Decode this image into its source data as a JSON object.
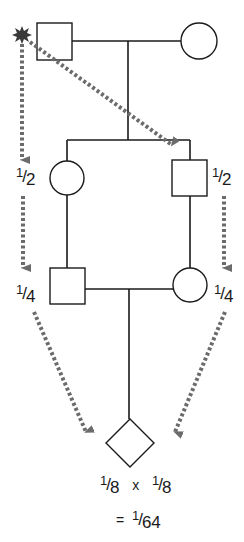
{
  "diagram": {
    "type": "pedigree",
    "colors": {
      "line": "#1a1a1a",
      "arrow": "#6b6b6b",
      "marker": "#3a3a3a",
      "background": "#ffffff"
    },
    "generations": [
      {
        "level": 1,
        "individuals": [
          {
            "id": "common-ancestor-male",
            "shape": "square",
            "marked": true
          },
          {
            "id": "ancestor-female",
            "shape": "circle"
          }
        ]
      },
      {
        "level": 2,
        "individuals": [
          {
            "id": "daughter",
            "shape": "circle"
          },
          {
            "id": "son",
            "shape": "square"
          }
        ]
      },
      {
        "level": 3,
        "individuals": [
          {
            "id": "grandson",
            "shape": "square"
          },
          {
            "id": "granddaughter",
            "shape": "circle"
          }
        ]
      },
      {
        "level": 4,
        "individuals": [
          {
            "id": "offspring",
            "shape": "diamond"
          }
        ]
      }
    ],
    "labels": {
      "left_gen2": {
        "num": "1",
        "den": "2"
      },
      "right_gen2": {
        "num": "1",
        "den": "2"
      },
      "left_gen3": {
        "num": "1",
        "den": "4"
      },
      "right_gen3": {
        "num": "1",
        "den": "4"
      },
      "product_left": {
        "num": "1",
        "den": "8"
      },
      "times": "x",
      "product_right": {
        "num": "1",
        "den": "8"
      },
      "equals": "=",
      "result": {
        "num": "1",
        "den": "64"
      }
    }
  }
}
